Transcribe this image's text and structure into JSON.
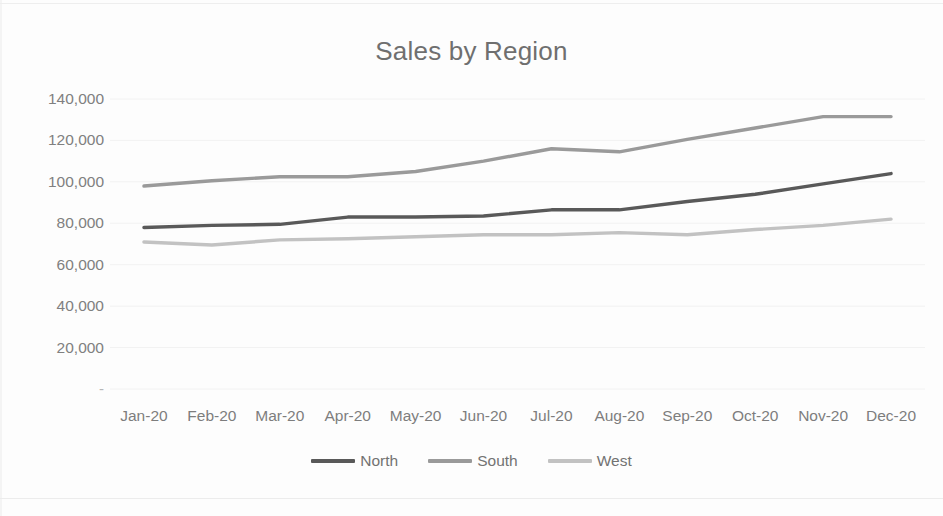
{
  "chart_data": {
    "type": "line",
    "title": "Sales by Region",
    "xlabel": "",
    "ylabel": "",
    "categories": [
      "Jan-20",
      "Feb-20",
      "Mar-20",
      "Apr-20",
      "May-20",
      "Jun-20",
      "Jul-20",
      "Aug-20",
      "Sep-20",
      "Oct-20",
      "Nov-20",
      "Dec-20"
    ],
    "series": [
      {
        "name": "North",
        "color": "#595959",
        "values": [
          78000,
          79000,
          79500,
          83000,
          83000,
          83500,
          86500,
          86500,
          90500,
          94000,
          99000,
          104000
        ]
      },
      {
        "name": "South",
        "color": "#9a9a9a",
        "values": [
          98000,
          100500,
          102500,
          102500,
          105000,
          110000,
          116000,
          114500,
          120500,
          126000,
          131500,
          131500
        ]
      },
      {
        "name": "West",
        "color": "#c2c2c2",
        "values": [
          71000,
          69500,
          72000,
          72500,
          73500,
          74500,
          74500,
          75500,
          74500,
          77000,
          79000,
          82000
        ]
      }
    ],
    "y_ticks": [
      "-",
      "20,000",
      "40,000",
      "60,000",
      "80,000",
      "100,000",
      "120,000",
      "140,000"
    ],
    "y_tick_values": [
      0,
      20000,
      40000,
      60000,
      80000,
      100000,
      120000,
      140000
    ],
    "ylim": [
      0,
      140000
    ],
    "grid": true,
    "grid_color": "#f2f2f2",
    "legend_position": "bottom",
    "axis_text_color": "#808080",
    "title_color": "#6f6f6f"
  },
  "legend": {
    "items": [
      {
        "label": "North"
      },
      {
        "label": "South"
      },
      {
        "label": "West"
      }
    ]
  }
}
